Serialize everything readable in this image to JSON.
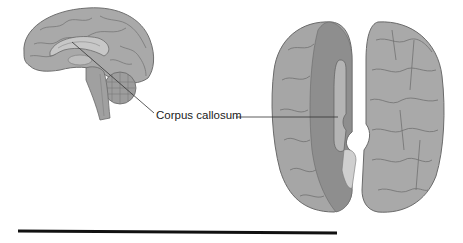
{
  "figure": {
    "label": "Corpus callosum",
    "views": [
      "sagittal-medial-view",
      "dorsal-split-view"
    ],
    "colors": {
      "brain_fill": "#a9a9a9",
      "sulci": "#6f6f6f",
      "cut_surface": "#8e8e8e",
      "cerebellum": "#9d9d9d",
      "leader_line": "#333333",
      "rule_line": "#111111"
    }
  }
}
